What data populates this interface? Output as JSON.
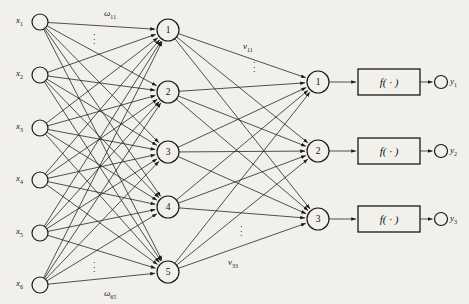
{
  "diagram": {
    "background_color": "#f2f0eb",
    "stroke_color": "#1a1a1a",
    "layers": {
      "input": {
        "name": "input-layer",
        "count": 6,
        "nodes": [
          {
            "label": "x",
            "sub": "1",
            "cx": 40,
            "cy": 22
          },
          {
            "label": "x",
            "sub": "2",
            "cx": 40,
            "cy": 75
          },
          {
            "label": "x",
            "sub": "3",
            "cx": 40,
            "cy": 128
          },
          {
            "label": "x",
            "sub": "4",
            "cx": 40,
            "cy": 180
          },
          {
            "label": "x",
            "sub": "5",
            "cx": 40,
            "cy": 233
          },
          {
            "label": "x",
            "sub": "6",
            "cx": 40,
            "cy": 285
          }
        ]
      },
      "hidden": {
        "name": "hidden-layer",
        "count": 5,
        "nodes": [
          {
            "label": "1",
            "cx": 168,
            "cy": 30
          },
          {
            "label": "2",
            "cx": 168,
            "cy": 92
          },
          {
            "label": "3",
            "cx": 168,
            "cy": 152
          },
          {
            "label": "4",
            "cx": 168,
            "cy": 207
          },
          {
            "label": "5",
            "cx": 168,
            "cy": 272
          }
        ]
      },
      "summation": {
        "name": "summation-layer",
        "count": 3,
        "nodes": [
          {
            "label": "1",
            "cx": 318,
            "cy": 82
          },
          {
            "label": "2",
            "cx": 318,
            "cy": 151
          },
          {
            "label": "3",
            "cx": 318,
            "cy": 219
          }
        ]
      },
      "activation": {
        "name": "activation-boxes",
        "label": "f( · )",
        "boxes": [
          {
            "x": 358,
            "y": 69,
            "w": 62,
            "h": 26
          },
          {
            "x": 358,
            "y": 138,
            "w": 62,
            "h": 26
          },
          {
            "x": 358,
            "y": 206,
            "w": 62,
            "h": 26
          }
        ]
      },
      "output": {
        "name": "output-layer",
        "count": 3,
        "nodes": [
          {
            "label": "y",
            "sub": "1",
            "cx": 441,
            "cy": 82
          },
          {
            "label": "y",
            "sub": "2",
            "cx": 441,
            "cy": 151
          },
          {
            "label": "y",
            "sub": "3",
            "cx": 441,
            "cy": 219
          }
        ]
      }
    },
    "edge_labels": [
      {
        "name": "weight-omega-11",
        "text": "ω",
        "sub": "11",
        "x": 104,
        "y": 8
      },
      {
        "name": "weight-omega-65",
        "text": "ω",
        "sub": "65",
        "x": 104,
        "y": 288
      },
      {
        "name": "weight-v-11",
        "text": "v",
        "sub": "11",
        "x": 243,
        "y": 41
      },
      {
        "name": "weight-v-33",
        "text": "v",
        "sub": "33",
        "x": 228,
        "y": 257
      }
    ],
    "ellipses": [
      {
        "name": "input-weight-ellipsis-top",
        "x": 93,
        "y": 30
      },
      {
        "name": "input-weight-ellipsis-bottom",
        "x": 93,
        "y": 258
      },
      {
        "name": "hidden-weight-ellipsis-top",
        "x": 253,
        "y": 58
      },
      {
        "name": "hidden-weight-ellipsis-bottom",
        "x": 240,
        "y": 222
      }
    ]
  }
}
